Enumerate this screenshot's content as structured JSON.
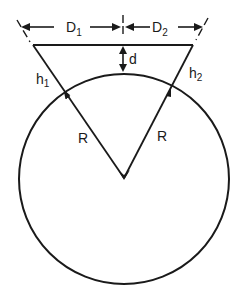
{
  "diagram": {
    "labels": {
      "D1": {
        "main": "D",
        "sub": "1"
      },
      "D2": {
        "main": "D",
        "sub": "2"
      },
      "d": "d",
      "h1": {
        "main": "h",
        "sub": "1"
      },
      "h2": {
        "main": "h",
        "sub": "2"
      },
      "R_left": "R",
      "R_right": "R"
    },
    "colors": {
      "stroke": "#1a1a1a",
      "background": "#ffffff"
    }
  }
}
